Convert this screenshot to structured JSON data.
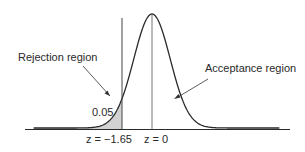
{
  "figure": {
    "type": "normal-distribution-hypothesis-test",
    "labels": {
      "rejection_region": "Rejection region",
      "acceptance_region": "Acceptance region",
      "alpha": "0.05"
    },
    "ticks": {
      "critical": "z = −1.65",
      "mean": "z = 0"
    },
    "colors": {
      "curve": "#2a2a2a",
      "shade": "#d2d2d2",
      "axis": "#2a2a2a",
      "lines": "#555555"
    }
  },
  "chart_data": {
    "type": "area",
    "title": "",
    "xlabel": "z",
    "ylabel": "",
    "distribution": "standard normal",
    "critical_value": -1.65,
    "mean": 0,
    "alpha": 0.05,
    "tail": "left",
    "regions": [
      {
        "name": "Rejection region",
        "range": [
          "-inf",
          -1.65
        ],
        "area": 0.05,
        "shaded": true
      },
      {
        "name": "Acceptance region",
        "range": [
          -1.65,
          "inf"
        ],
        "area": 0.95,
        "shaded": false
      }
    ],
    "tick_labels": [
      "z = −1.65",
      "z = 0"
    ],
    "grid": false,
    "legend": "none"
  }
}
